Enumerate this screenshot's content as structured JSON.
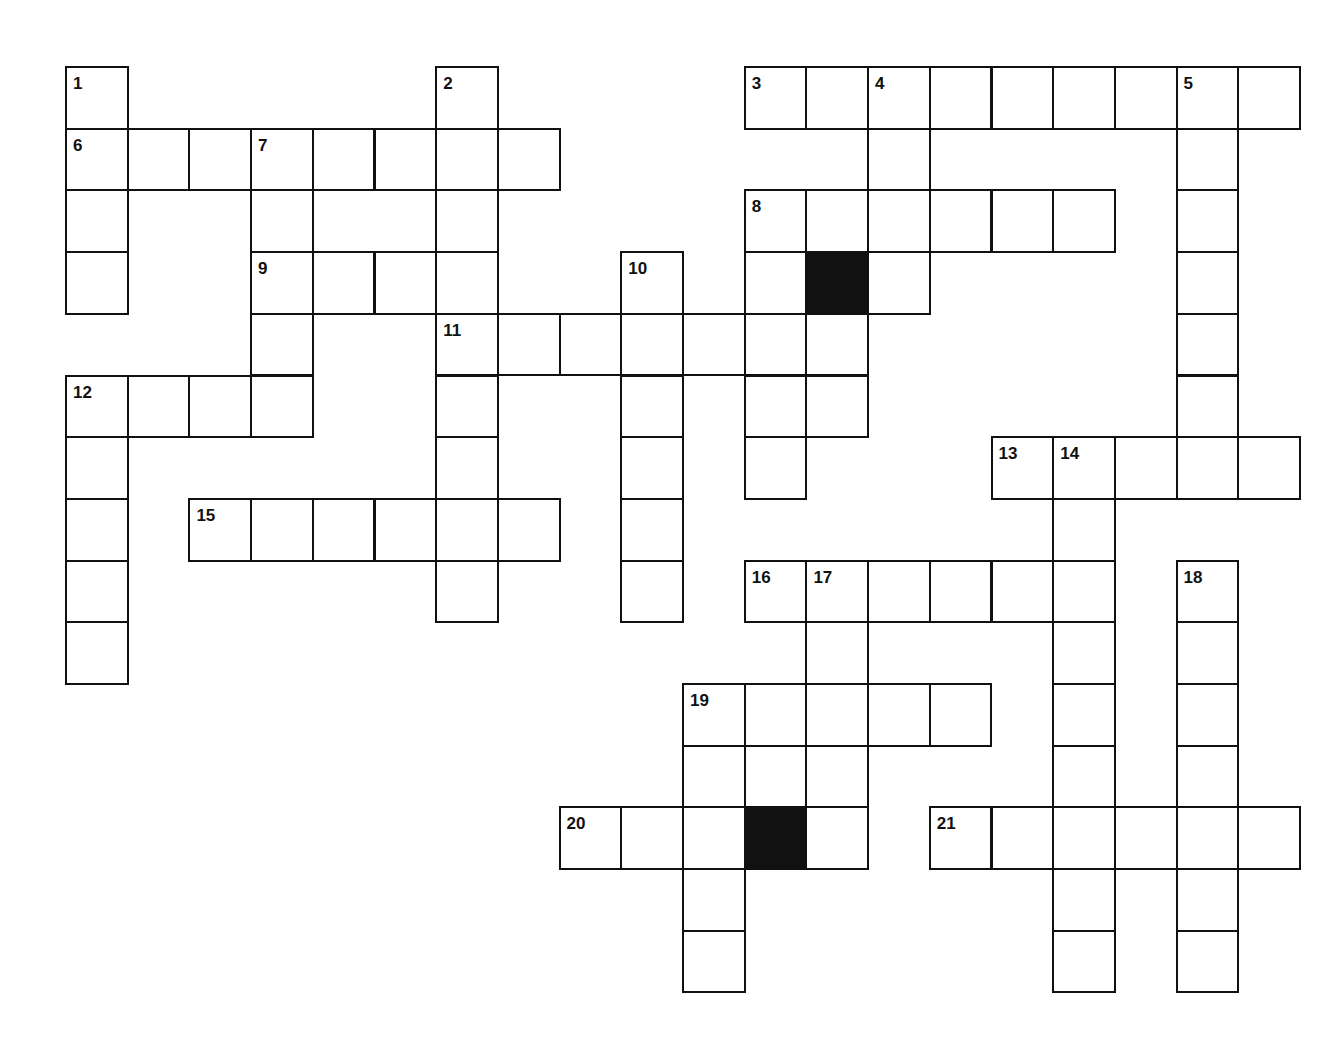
{
  "puzzle": {
    "title": "Crossword Puzzle Grid",
    "grid": {
      "cell_size": 61.7,
      "origin_x": 65,
      "origin_y": 66,
      "columns": 20,
      "rows": 16,
      "border_color": "#111111",
      "cell_fill": "#ffffff",
      "block_fill": "#111111"
    },
    "blocked_cells": [
      {
        "row": 3,
        "col": 12
      },
      {
        "row": 12,
        "col": 11
      }
    ],
    "clue_numbers": [
      {
        "number": "1",
        "row": 0,
        "col": 0
      },
      {
        "number": "2",
        "row": 0,
        "col": 6
      },
      {
        "number": "3",
        "row": 0,
        "col": 11
      },
      {
        "number": "4",
        "row": 0,
        "col": 13
      },
      {
        "number": "5",
        "row": 0,
        "col": 18
      },
      {
        "number": "6",
        "row": 1,
        "col": 0
      },
      {
        "number": "7",
        "row": 1,
        "col": 3
      },
      {
        "number": "8",
        "row": 2,
        "col": 11
      },
      {
        "number": "9",
        "row": 3,
        "col": 3
      },
      {
        "number": "10",
        "row": 3,
        "col": 9
      },
      {
        "number": "11",
        "row": 4,
        "col": 6
      },
      {
        "number": "12",
        "row": 5,
        "col": 0
      },
      {
        "number": "13",
        "row": 6,
        "col": 15
      },
      {
        "number": "14",
        "row": 6,
        "col": 16
      },
      {
        "number": "15",
        "row": 7,
        "col": 2
      },
      {
        "number": "16",
        "row": 8,
        "col": 11
      },
      {
        "number": "17",
        "row": 8,
        "col": 12
      },
      {
        "number": "18",
        "row": 8,
        "col": 18
      },
      {
        "number": "19",
        "row": 10,
        "col": 10
      },
      {
        "number": "20",
        "row": 12,
        "col": 8
      },
      {
        "number": "21",
        "row": 12,
        "col": 14
      }
    ],
    "cells": [
      {
        "row": 0,
        "col": 0
      },
      {
        "row": 0,
        "col": 6
      },
      {
        "row": 0,
        "col": 11
      },
      {
        "row": 0,
        "col": 12
      },
      {
        "row": 0,
        "col": 13
      },
      {
        "row": 0,
        "col": 14
      },
      {
        "row": 0,
        "col": 15
      },
      {
        "row": 0,
        "col": 16
      },
      {
        "row": 0,
        "col": 17
      },
      {
        "row": 0,
        "col": 18
      },
      {
        "row": 0,
        "col": 19
      },
      {
        "row": 1,
        "col": 0
      },
      {
        "row": 1,
        "col": 1
      },
      {
        "row": 1,
        "col": 2
      },
      {
        "row": 1,
        "col": 3
      },
      {
        "row": 1,
        "col": 4
      },
      {
        "row": 1,
        "col": 5
      },
      {
        "row": 1,
        "col": 6
      },
      {
        "row": 1,
        "col": 7
      },
      {
        "row": 1,
        "col": 13
      },
      {
        "row": 1,
        "col": 18
      },
      {
        "row": 2,
        "col": 0
      },
      {
        "row": 2,
        "col": 3
      },
      {
        "row": 2,
        "col": 6
      },
      {
        "row": 2,
        "col": 11
      },
      {
        "row": 2,
        "col": 12
      },
      {
        "row": 2,
        "col": 13
      },
      {
        "row": 2,
        "col": 14
      },
      {
        "row": 2,
        "col": 15
      },
      {
        "row": 2,
        "col": 16
      },
      {
        "row": 2,
        "col": 18
      },
      {
        "row": 3,
        "col": 0
      },
      {
        "row": 3,
        "col": 3
      },
      {
        "row": 3,
        "col": 4
      },
      {
        "row": 3,
        "col": 5
      },
      {
        "row": 3,
        "col": 6
      },
      {
        "row": 3,
        "col": 9
      },
      {
        "row": 3,
        "col": 11
      },
      {
        "row": 3,
        "col": 12
      },
      {
        "row": 3,
        "col": 13
      },
      {
        "row": 3,
        "col": 18
      },
      {
        "row": 4,
        "col": 3
      },
      {
        "row": 4,
        "col": 6
      },
      {
        "row": 4,
        "col": 7
      },
      {
        "row": 4,
        "col": 8
      },
      {
        "row": 4,
        "col": 9
      },
      {
        "row": 4,
        "col": 10
      },
      {
        "row": 4,
        "col": 11
      },
      {
        "row": 4,
        "col": 12
      },
      {
        "row": 4,
        "col": 18
      },
      {
        "row": 5,
        "col": 0
      },
      {
        "row": 5,
        "col": 1
      },
      {
        "row": 5,
        "col": 2
      },
      {
        "row": 5,
        "col": 3
      },
      {
        "row": 5,
        "col": 6
      },
      {
        "row": 5,
        "col": 9
      },
      {
        "row": 5,
        "col": 11
      },
      {
        "row": 5,
        "col": 12
      },
      {
        "row": 5,
        "col": 18
      },
      {
        "row": 6,
        "col": 0
      },
      {
        "row": 6,
        "col": 6
      },
      {
        "row": 6,
        "col": 9
      },
      {
        "row": 6,
        "col": 11
      },
      {
        "row": 6,
        "col": 15
      },
      {
        "row": 6,
        "col": 16
      },
      {
        "row": 6,
        "col": 17
      },
      {
        "row": 6,
        "col": 18
      },
      {
        "row": 6,
        "col": 19
      },
      {
        "row": 7,
        "col": 0
      },
      {
        "row": 7,
        "col": 2
      },
      {
        "row": 7,
        "col": 3
      },
      {
        "row": 7,
        "col": 4
      },
      {
        "row": 7,
        "col": 5
      },
      {
        "row": 7,
        "col": 6
      },
      {
        "row": 7,
        "col": 7
      },
      {
        "row": 7,
        "col": 9
      },
      {
        "row": 7,
        "col": 16
      },
      {
        "row": 8,
        "col": 0
      },
      {
        "row": 8,
        "col": 6
      },
      {
        "row": 8,
        "col": 9
      },
      {
        "row": 8,
        "col": 11
      },
      {
        "row": 8,
        "col": 12
      },
      {
        "row": 8,
        "col": 13
      },
      {
        "row": 8,
        "col": 14
      },
      {
        "row": 8,
        "col": 15
      },
      {
        "row": 8,
        "col": 16
      },
      {
        "row": 8,
        "col": 18
      },
      {
        "row": 9,
        "col": 0
      },
      {
        "row": 9,
        "col": 12
      },
      {
        "row": 9,
        "col": 16
      },
      {
        "row": 9,
        "col": 18
      },
      {
        "row": 10,
        "col": 10
      },
      {
        "row": 10,
        "col": 11
      },
      {
        "row": 10,
        "col": 12
      },
      {
        "row": 10,
        "col": 13
      },
      {
        "row": 10,
        "col": 14
      },
      {
        "row": 10,
        "col": 16
      },
      {
        "row": 10,
        "col": 18
      },
      {
        "row": 11,
        "col": 10
      },
      {
        "row": 11,
        "col": 11
      },
      {
        "row": 11,
        "col": 12
      },
      {
        "row": 11,
        "col": 16
      },
      {
        "row": 11,
        "col": 18
      },
      {
        "row": 12,
        "col": 8
      },
      {
        "row": 12,
        "col": 9
      },
      {
        "row": 12,
        "col": 10
      },
      {
        "row": 12,
        "col": 11
      },
      {
        "row": 12,
        "col": 12
      },
      {
        "row": 12,
        "col": 14
      },
      {
        "row": 12,
        "col": 15
      },
      {
        "row": 12,
        "col": 16
      },
      {
        "row": 12,
        "col": 17
      },
      {
        "row": 12,
        "col": 18
      },
      {
        "row": 12,
        "col": 19
      },
      {
        "row": 13,
        "col": 10
      },
      {
        "row": 13,
        "col": 16
      },
      {
        "row": 13,
        "col": 18
      },
      {
        "row": 14,
        "col": 10
      },
      {
        "row": 14,
        "col": 16
      },
      {
        "row": 14,
        "col": 18
      }
    ]
  }
}
